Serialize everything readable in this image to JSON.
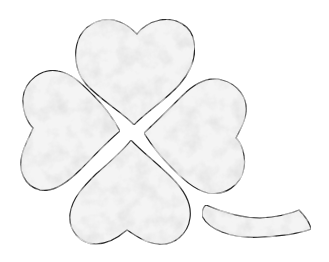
{
  "illustration": {
    "subject": "four-leaf clover",
    "leaves": [
      "top",
      "left",
      "right",
      "bottom"
    ],
    "stem": "detached curved stem",
    "colors": {
      "background": "#ffffff",
      "outline": "#2a2a2a",
      "fill_light": "#f4f4f4",
      "fill_mottle": "#c8c8c8"
    }
  }
}
